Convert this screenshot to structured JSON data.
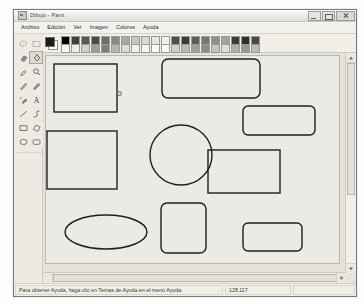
{
  "window": {
    "title": "Dibujo - Paint",
    "app_icon": "paint-app-icon",
    "controls": {
      "minimize": "minimize-button",
      "maximize": "maximize-button",
      "close": "close-button"
    }
  },
  "menubar": {
    "items": [
      {
        "label": "Archivo"
      },
      {
        "label": "Edición"
      },
      {
        "label": "Ver"
      },
      {
        "label": "Imagen"
      },
      {
        "label": "Colores"
      },
      {
        "label": "Ayuda"
      }
    ]
  },
  "toolbox": {
    "tools": [
      {
        "name": "free-form-select-tool",
        "selected": false
      },
      {
        "name": "rectangle-select-tool",
        "selected": false
      },
      {
        "name": "eraser-tool",
        "selected": false
      },
      {
        "name": "fill-with-color-tool",
        "selected": true
      },
      {
        "name": "pick-color-tool",
        "selected": false
      },
      {
        "name": "magnifier-tool",
        "selected": false
      },
      {
        "name": "pencil-tool",
        "selected": false
      },
      {
        "name": "brush-tool",
        "selected": false
      },
      {
        "name": "airbrush-tool",
        "selected": false
      },
      {
        "name": "text-tool",
        "selected": false
      },
      {
        "name": "line-tool",
        "selected": false
      },
      {
        "name": "curve-tool",
        "selected": false
      },
      {
        "name": "rectangle-tool",
        "selected": false
      },
      {
        "name": "polygon-tool",
        "selected": false
      },
      {
        "name": "ellipse-tool",
        "selected": false
      },
      {
        "name": "rounded-rectangle-tool",
        "selected": false
      }
    ]
  },
  "palette": {
    "foreground_color": "#1b1b1b",
    "background_color": "#ffffff",
    "row_top": [
      "#000000",
      "#3f3f3f",
      "#565656",
      "#4a4a4a",
      "#6e6e6e",
      "#8a8a8a",
      "#a8a8a8",
      "#c6c6c6",
      "#d8d8d8",
      "#e6e6e6",
      "#f0f0f0",
      "#4e4e4e",
      "#3a3a3a",
      "#5c5c5c",
      "#767676",
      "#8e8e8e",
      "#a2a2a2",
      "#3c3c3c",
      "#2e2e2e",
      "#474747"
    ],
    "row_bottom": [
      "#f4f4f4",
      "#ececec",
      "#cfcfcf",
      "#9c9c9c",
      "#7d7d7d",
      "#b4b4b4",
      "#dcdcdc",
      "#efefef",
      "#f6f6f6",
      "#fafafa",
      "#fcfcfc",
      "#d0d0d0",
      "#b8b8b8",
      "#a0a0a0",
      "#8b8b8b",
      "#c4c4c4",
      "#dedede",
      "#aeaeae",
      "#969696",
      "#bcbcbc"
    ]
  },
  "canvas": {
    "background": "#eceae4",
    "stroke_color": "#1f1f1f",
    "cursor": {
      "x": 72,
      "y": 36,
      "glyph": "fill-bucket-cursor"
    },
    "shapes": [
      {
        "name": "rectangle-1",
        "type": "rect",
        "x": 8,
        "y": 8,
        "w": 63,
        "h": 48,
        "r": 0
      },
      {
        "name": "rounded-rectangle-1",
        "type": "rect",
        "x": 116,
        "y": 3,
        "w": 98,
        "h": 39,
        "r": 6
      },
      {
        "name": "rounded-rectangle-2",
        "type": "rect",
        "x": 197,
        "y": 50,
        "w": 72,
        "h": 29,
        "r": 5
      },
      {
        "name": "square-1",
        "type": "rect",
        "x": 1,
        "y": 75,
        "w": 70,
        "h": 58,
        "r": 0
      },
      {
        "name": "circle-1",
        "type": "ellipse",
        "cx": 135,
        "cy": 99,
        "rx": 31,
        "ry": 30
      },
      {
        "name": "rectangle-2",
        "type": "rect",
        "x": 162,
        "y": 94,
        "w": 72,
        "h": 43,
        "r": 0
      },
      {
        "name": "ellipse-1",
        "type": "ellipse",
        "cx": 60,
        "cy": 176,
        "rx": 41,
        "ry": 17
      },
      {
        "name": "rounded-square-1",
        "type": "rect",
        "x": 115,
        "y": 147,
        "w": 45,
        "h": 50,
        "r": 6
      },
      {
        "name": "rounded-rectangle-3",
        "type": "rect",
        "x": 197,
        "y": 167,
        "w": 59,
        "h": 28,
        "r": 5
      }
    ]
  },
  "scrollbars": {
    "vertical": "vertical-scrollbar",
    "horizontal": "horizontal-scrollbar"
  },
  "statusbar": {
    "help_text": "Para obtener Ayuda, haga clic en Temas de Ayuda en el menú Ayuda.",
    "coordinates": "128,117"
  }
}
